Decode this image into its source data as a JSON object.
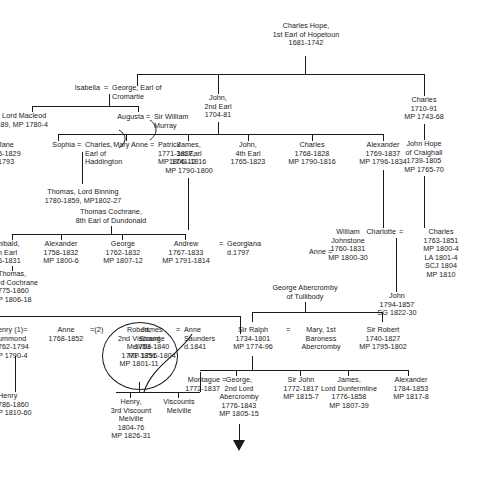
{
  "diagram": {
    "accent_color": "#1a1a1a",
    "background_color": "#ffffff"
  },
  "nodes": {
    "charles_hope_1st_earl": "Charles Hope,\n1st Earl of Hopetoun\n1681-1742",
    "isabella": "Isabella",
    "george_earl_cromartie": "George, Earl of\nCromartie",
    "lord_macleod": ", Lord Macleod\n-89, MP 1780-4",
    "augusta": "Augusta",
    "sir_william_murray": "Sir William\nMurray",
    "john_2nd_earl": "John,\n2nd Earl\n1704-81",
    "charles_1710": "Charles\n1710-91\nMP 1743-68",
    "jane": "Jane\n5-1829\n1793",
    "sophia": "Sophia",
    "charles_earl_haddington": "Charles,\nEarl of\nHaddington",
    "mary_anne": "Mary Anne",
    "patrick": "Patrick\n1771-1837,\nMP1806-12",
    "james_3rd_earl": "James,\n3rd Earl\n1741-1816\nMP 1790-1800",
    "john_4th_earl": "John,\n4th Earl\n1765-1823",
    "charles_1768": "Charles\n1768-1828\nMP 1790-1816",
    "alexander_1769": "Alexander\n1769-1837\nMP 1796-1834",
    "john_hope_craighall": "John Hope\nof Craighall\n1739-1805\nMP 1765-70",
    "thomas_lord_binning": "Thomas, Lord Binning\n1780-1859, MP1802-27",
    "thomas_cochrane": "Thomas Cochrane,\n8th Earl of Dundonald",
    "archibald_earl": "hibald,\nh Earl\n6-1831",
    "thomas_lord_cochrane": "Thomas,\nrd Cochrane\n775-1860\nP 1806-18",
    "alexander_1758": "Alexander\n1758-1832\nMP 1800-6",
    "george_1762": "George\n1762-1832\nMP 1807-12",
    "andrew_1767": "Andrew\n1767-1833\nMP 1791-1814",
    "georgiana": "Georgiana\nd.1797",
    "anne_right": "Anne",
    "william_johnstone": "William\nJohnstone\n1760-1831\nMP 1800-30",
    "charlotte": "Charlotte",
    "charles_1763": "Charles\n1763-1851\nMP 1800-4\nLA 1801-4\nSCJ 1804\nMP 1810",
    "george_abercromby_tullibody": "George Abercromby\nof Tullibody",
    "john_1794": "John\n1794-1857\nSG 1822-30",
    "henry_1": "enry (1)=\nummond\n762-1794\nP 1790-4",
    "anne_1768": "Anne",
    "anne_dates": "1768-1852",
    "james_strange": "James\nStrange\n1753-1840\nMP 1796-1804",
    "robert_2nd_viscount_melville": "Robert,\n2nd Viscount\nMelville\n1771-1851\nMP 1801-11",
    "anne_saunders": "Anne\nSaunders\nd.1841",
    "sir_ralph": "Sir Ralph\n1734-1801\nMP 1774-96",
    "mary_1st_baroness": "Mary, 1st\nBaroness\nAbercromby",
    "sir_robert_1740": "Sir Robert\n1740-1827\nMP 1795-1802",
    "henry_1786": "Henry\n786-1860\nP 1810-60",
    "henry_3rd_viscount": "Henry,\n3rd Viscount\nMelville\n1804-76\nMP 1826-31",
    "viscounts_melville": "Viscounts\nMelville",
    "montague": "Montague\n1772-1837",
    "george_2nd_lord_abercromby": "George,\n2nd Lord\nAbercromby\n1776-1843\nMP 1805-15",
    "sir_john_1772": "Sir John\n1772-1817\nMP 1815-7",
    "james_lord_dunfermline": "James,\nLord Dunfermline\n1776-1858\nMP 1807-39",
    "alexander_1784": "Alexander\n1784-1853\nMP 1817-8"
  },
  "marriage_symbols": {
    "isabella_george": "=",
    "augusta_murray": "=",
    "sophia_charles": "=",
    "mary_anne_patrick": "=",
    "andrew_georgiana": "=",
    "anne_william": "=",
    "charlotte_charles": "=",
    "anne_2": "=(2)",
    "robert_anne": "=",
    "ralph_mary": "=",
    "montague_george": "="
  }
}
